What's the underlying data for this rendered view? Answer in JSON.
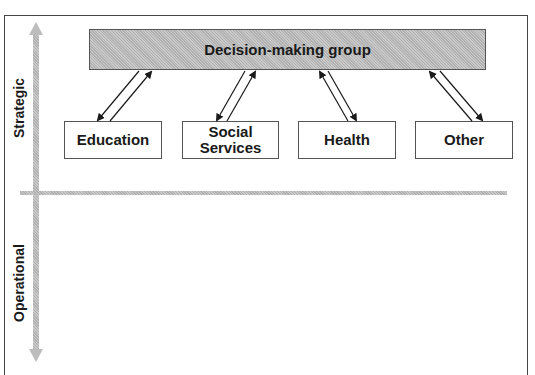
{
  "diagram": {
    "top_box": {
      "label": "Decision-making group"
    },
    "nodes": [
      {
        "label": "Education"
      },
      {
        "label": "Social Services"
      },
      {
        "label": "Health"
      },
      {
        "label": "Other"
      }
    ],
    "axis": {
      "upper_label": "Strategic",
      "lower_label": "Operational"
    },
    "colors": {
      "hatch_fill": "#c9c9c9",
      "border": "#555555",
      "text": "#1a1a1a"
    }
  }
}
